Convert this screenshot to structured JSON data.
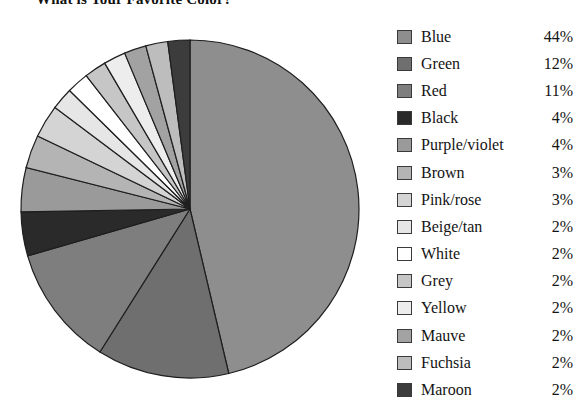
{
  "chart_data": {
    "type": "pie",
    "title": "What is Your Favorite Color?",
    "xlabel": "",
    "ylabel": "",
    "legend_position": "right",
    "grid": false,
    "start_angle_deg": 0,
    "direction": "clockwise",
    "units": "percent",
    "categories": [
      "Blue",
      "Green",
      "Red",
      "Black",
      "Purple/violet",
      "Brown",
      "Pink/rose",
      "Beige/tan",
      "White",
      "Grey",
      "Yellow",
      "Mauve",
      "Fuchsia",
      "Maroon"
    ],
    "values": [
      44,
      12,
      11,
      4,
      4,
      3,
      3,
      2,
      2,
      2,
      2,
      2,
      2,
      2
    ],
    "labels": [
      "44%",
      "12%",
      "11%",
      "4%",
      "4%",
      "3%",
      "3%",
      "2%",
      "2%",
      "2%",
      "2%",
      "2%",
      "2%",
      "2%"
    ],
    "slice_colors": [
      "#8e8e8e",
      "#6f6f6f",
      "#7e7e7e",
      "#2a2a2a",
      "#9a9a9a",
      "#b4b4b4",
      "#d4d4d4",
      "#e6e6e6",
      "#ffffff",
      "#c6c6c6",
      "#ededed",
      "#a2a2a2",
      "#bdbdbd",
      "#3c3c3c"
    ],
    "slice_edge_color": "#1e1e1e"
  },
  "legend": {
    "rows": [
      {
        "label": "Blue",
        "pct": "44%",
        "swatch": "#8e8e8e"
      },
      {
        "label": "Green",
        "pct": "12%",
        "swatch": "#6f6f6f"
      },
      {
        "label": "Red",
        "pct": "11%",
        "swatch": "#7e7e7e"
      },
      {
        "label": "Black",
        "pct": "4%",
        "swatch": "#2a2a2a"
      },
      {
        "label": "Purple/violet",
        "pct": "4%",
        "swatch": "#9a9a9a"
      },
      {
        "label": "Brown",
        "pct": "3%",
        "swatch": "#b4b4b4"
      },
      {
        "label": "Pink/rose",
        "pct": "3%",
        "swatch": "#d4d4d4"
      },
      {
        "label": "Beige/tan",
        "pct": "2%",
        "swatch": "#e6e6e6"
      },
      {
        "label": "White",
        "pct": "2%",
        "swatch": "#ffffff"
      },
      {
        "label": "Grey",
        "pct": "2%",
        "swatch": "#c6c6c6"
      },
      {
        "label": "Yellow",
        "pct": "2%",
        "swatch": "#ededed"
      },
      {
        "label": "Mauve",
        "pct": "2%",
        "swatch": "#a2a2a2"
      },
      {
        "label": "Fuchsia",
        "pct": "2%",
        "swatch": "#bdbdbd"
      },
      {
        "label": "Maroon",
        "pct": "2%",
        "swatch": "#3c3c3c"
      }
    ]
  },
  "geometry": {
    "center_x": 190,
    "center_y": 209,
    "radius": 169
  }
}
